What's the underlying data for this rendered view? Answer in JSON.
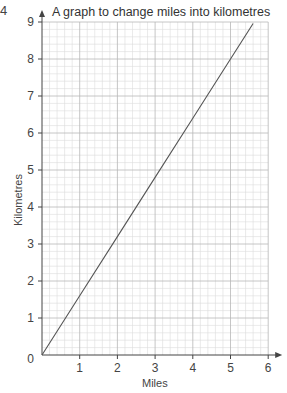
{
  "question_number": "4",
  "chart_data": {
    "type": "line",
    "title": "A graph to change miles into kilometres",
    "xlabel": "Miles",
    "ylabel": "Kilometres",
    "xlim": [
      0,
      6
    ],
    "ylim": [
      0,
      9
    ],
    "x_ticks": [
      "1",
      "2",
      "3",
      "4",
      "5",
      "6"
    ],
    "y_ticks": [
      "0",
      "1",
      "2",
      "3",
      "4",
      "5",
      "6",
      "7",
      "8",
      "9"
    ],
    "grid": true,
    "minor_grid_per_unit": 5,
    "series": [
      {
        "name": "miles to kilometres",
        "x": [
          0,
          1,
          2,
          3,
          4,
          5,
          5.6
        ],
        "y": [
          0,
          1.6,
          3.2,
          4.8,
          6.4,
          8.0,
          8.96
        ]
      }
    ],
    "colors": {
      "line": "#555555",
      "grid_major": "#b8b8b8",
      "grid_minor": "#dcdcdc",
      "axis": "#444444"
    }
  }
}
